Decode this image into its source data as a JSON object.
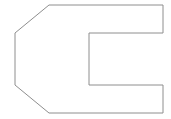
{
  "canvas": {
    "width": 171,
    "height": 119,
    "background_color": "#ffffff",
    "title": "C-shaped chamfered outline drawing"
  },
  "drawing": {
    "name": "c-shape-outline",
    "description": "Line-art outline of a C-shaped (bracket) profile with two chamfered corners on the left side",
    "stroke_color": "#8e8e8e",
    "fill_color": "#ffffff",
    "stroke_width": 1,
    "closed": true,
    "vertex_count": 10,
    "points": "49,5 163,5 163,33 89,33 89,85 163,85 163,113 49,113 15,85 15,33",
    "vertices": [
      {
        "label": "top-chamfer-end",
        "x": 49,
        "y": 5
      },
      {
        "label": "top-right",
        "x": 163,
        "y": 5
      },
      {
        "label": "upper-arm-inner-right",
        "x": 163,
        "y": 33
      },
      {
        "label": "notch-top-left",
        "x": 89,
        "y": 33
      },
      {
        "label": "notch-bottom-left",
        "x": 89,
        "y": 85
      },
      {
        "label": "lower-arm-inner-right",
        "x": 163,
        "y": 85
      },
      {
        "label": "bottom-right",
        "x": 163,
        "y": 113
      },
      {
        "label": "bottom-chamfer-start",
        "x": 49,
        "y": 113
      },
      {
        "label": "bottom-chamfer-end",
        "x": 15,
        "y": 85
      },
      {
        "label": "top-chamfer-start",
        "x": 15,
        "y": 33
      }
    ],
    "edges": [
      {
        "name": "top-edge",
        "from": "top-chamfer-end",
        "to": "top-right",
        "orientation": "horizontal",
        "length": 114
      },
      {
        "name": "right-upper-edge",
        "from": "top-right",
        "to": "upper-arm-inner-right",
        "orientation": "vertical",
        "length": 28
      },
      {
        "name": "notch-top-edge",
        "from": "upper-arm-inner-right",
        "to": "notch-top-left",
        "orientation": "horizontal",
        "length": 74
      },
      {
        "name": "notch-back-edge",
        "from": "notch-top-left",
        "to": "notch-bottom-left",
        "orientation": "vertical",
        "length": 52
      },
      {
        "name": "notch-bottom-edge",
        "from": "notch-bottom-left",
        "to": "lower-arm-inner-right",
        "orientation": "horizontal",
        "length": 74
      },
      {
        "name": "right-lower-edge",
        "from": "lower-arm-inner-right",
        "to": "bottom-right",
        "orientation": "vertical",
        "length": 28
      },
      {
        "name": "bottom-edge",
        "from": "bottom-right",
        "to": "bottom-chamfer-start",
        "orientation": "horizontal",
        "length": 114
      },
      {
        "name": "bottom-left-chamfer",
        "from": "bottom-chamfer-start",
        "to": "bottom-chamfer-end",
        "orientation": "diagonal",
        "length": 44
      },
      {
        "name": "left-edge",
        "from": "bottom-chamfer-end",
        "to": "top-chamfer-start",
        "orientation": "vertical",
        "length": 52
      },
      {
        "name": "top-left-chamfer",
        "from": "top-chamfer-start",
        "to": "top-chamfer-end",
        "orientation": "diagonal",
        "length": 44
      }
    ]
  }
}
